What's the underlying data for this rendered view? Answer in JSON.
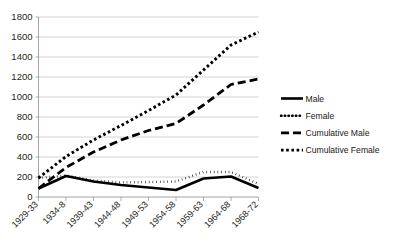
{
  "chart_data": {
    "type": "line",
    "title": "",
    "subtitle": "",
    "xlabel": "",
    "ylabel": "",
    "ylim": [
      0,
      1800
    ],
    "ytick_step": 200,
    "yticks": [
      0,
      200,
      400,
      600,
      800,
      1000,
      1200,
      1400,
      1600,
      1800
    ],
    "ytick_labels": [
      "0",
      "200",
      "400",
      "600",
      "800",
      "1000",
      "1200",
      "1400",
      "1600",
      "1800"
    ],
    "grid": "horizontal",
    "legend_position": "right",
    "categories": [
      "1929-33",
      "1934-8",
      "1939-43",
      "1944-48",
      "1949-53",
      "1954-58",
      "1959-63",
      "1964-68",
      "1968-72"
    ],
    "series": [
      {
        "name": "Male",
        "style": "solid-thick",
        "values": [
          85,
          210,
          155,
          120,
          95,
          70,
          185,
          205,
          90
        ]
      },
      {
        "name": "Female",
        "style": "fine-dotted",
        "values": [
          190,
          215,
          165,
          145,
          150,
          155,
          250,
          250,
          130
        ]
      },
      {
        "name": "Cumulative Male",
        "style": "long-dashed",
        "values": [
          85,
          295,
          450,
          570,
          665,
          735,
          920,
          1125,
          1180
        ]
      },
      {
        "name": "Cumulative Female",
        "style": "square-dotted",
        "values": [
          190,
          405,
          570,
          715,
          865,
          1020,
          1270,
          1520,
          1650
        ]
      }
    ]
  },
  "legend": {
    "items": [
      {
        "label": "Male",
        "swatch": "solid-thick-line-swatch"
      },
      {
        "label": "Female",
        "swatch": "fine-dotted-line-swatch"
      },
      {
        "label": "Cumulative Male",
        "swatch": "long-dashed-line-swatch"
      },
      {
        "label": "Cumulative Female",
        "swatch": "square-dotted-line-swatch"
      }
    ]
  },
  "colors": {
    "series": "#000000",
    "gridline": "#c9c9c9",
    "axis": "#9a9a9a",
    "text": "#231f20",
    "background": "#ffffff"
  }
}
